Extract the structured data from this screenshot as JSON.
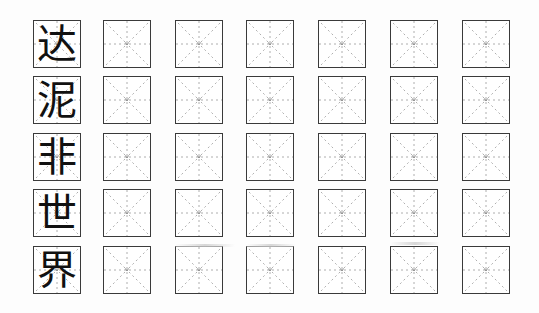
{
  "worksheet": {
    "type": "mi-zi-ge character practice grid",
    "columns": 7,
    "rows": [
      {
        "model_character": "达",
        "practice_cells": 6
      },
      {
        "model_character": "泥",
        "practice_cells": 6
      },
      {
        "model_character": "非",
        "practice_cells": 6
      },
      {
        "model_character": "世",
        "practice_cells": 6
      },
      {
        "model_character": "界",
        "practice_cells": 6
      }
    ],
    "colors": {
      "border": "#3a3a3a",
      "guide_lines": "#9a9a9a",
      "ink": "#111111",
      "paper": "#ffffff"
    }
  }
}
